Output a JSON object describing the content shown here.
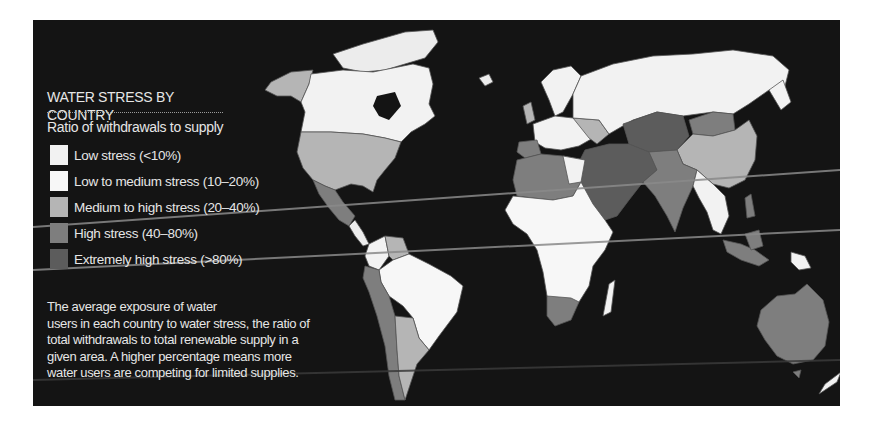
{
  "title": {
    "line1": "WATER STRESS BY",
    "line2": "COUNTRY"
  },
  "legend": {
    "heading": "Ratio of withdrawals to supply",
    "items": [
      {
        "label": "Low stress (<10%)",
        "color": "#f2f2f2"
      },
      {
        "label": "Low to medium stress (10–20%)",
        "color": "#f7f7f7"
      },
      {
        "label": "Medium to high stress (20–40%)",
        "color": "#b5b5b5"
      },
      {
        "label": "High stress (40–80%)",
        "color": "#7e7e7e"
      },
      {
        "label": "Extremely high stress (>80%)",
        "color": "#5c5c5c"
      }
    ]
  },
  "description_lines": [
    "The average exposure of water",
    "users in each country to water stress, the ratio of",
    "total withdrawals to total renewable supply in a",
    "given area. A higher percentage means more",
    "water users are competing for limited supplies."
  ],
  "colors": {
    "background": "#141414",
    "ocean": "#141414",
    "text": "#e6e6e6",
    "low": "#f2f2f2",
    "low_medium": "#f7f7f7",
    "medium_high": "#b5b5b5",
    "high": "#7e7e7e",
    "extremely_high": "#5c5c5c",
    "border": "#555555",
    "scan_line": "#8a8a8a"
  },
  "regions": [
    {
      "name": "Alaska",
      "category": "medium_high"
    },
    {
      "name": "Canada",
      "category": "low"
    },
    {
      "name": "United States",
      "category": "medium_high"
    },
    {
      "name": "Mexico",
      "category": "high"
    },
    {
      "name": "Central America",
      "category": "low"
    },
    {
      "name": "Venezuela",
      "category": "medium_high"
    },
    {
      "name": "Brazil",
      "category": "low"
    },
    {
      "name": "Peru / Chile",
      "category": "high"
    },
    {
      "name": "Argentina",
      "category": "medium_high"
    },
    {
      "name": "Greenland",
      "category": "low"
    },
    {
      "name": "Europe",
      "category": "low"
    },
    {
      "name": "Russia",
      "category": "low"
    },
    {
      "name": "North Africa",
      "category": "high"
    },
    {
      "name": "Sub-Saharan Africa",
      "category": "low"
    },
    {
      "name": "South Africa",
      "category": "high"
    },
    {
      "name": "Middle East",
      "category": "extremely_high"
    },
    {
      "name": "Central Asia",
      "category": "extremely_high"
    },
    {
      "name": "Mongolia",
      "category": "high"
    },
    {
      "name": "China",
      "category": "medium_high"
    },
    {
      "name": "India",
      "category": "high"
    },
    {
      "name": "Southeast Asia",
      "category": "low"
    },
    {
      "name": "Indonesia",
      "category": "high"
    },
    {
      "name": "Papua New Guinea",
      "category": "low"
    },
    {
      "name": "Australia",
      "category": "high"
    },
    {
      "name": "New Zealand",
      "category": "low"
    },
    {
      "name": "Madagascar",
      "category": "low"
    }
  ]
}
